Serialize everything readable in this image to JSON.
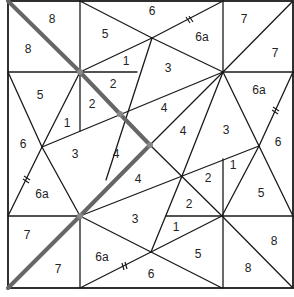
{
  "diagram": {
    "title": "",
    "colors": {
      "edge": "#1a1a1a",
      "highlight_path": "#666666",
      "node": "#888888",
      "background": "#ffffff"
    },
    "labels": [
      {
        "text": "8",
        "x": 52,
        "y": 20
      },
      {
        "text": "8",
        "x": 28,
        "y": 50
      },
      {
        "text": "5",
        "x": 105,
        "y": 35
      },
      {
        "text": "6",
        "x": 152,
        "y": 12
      },
      {
        "text": "6a",
        "x": 202,
        "y": 38
      },
      {
        "text": "7",
        "x": 244,
        "y": 20
      },
      {
        "text": "7",
        "x": 275,
        "y": 54
      },
      {
        "text": "1",
        "x": 126,
        "y": 62
      },
      {
        "text": "3",
        "x": 168,
        "y": 69
      },
      {
        "text": "5",
        "x": 40,
        "y": 96
      },
      {
        "text": "2",
        "x": 113,
        "y": 85
      },
      {
        "text": "2",
        "x": 92,
        "y": 105
      },
      {
        "text": "1",
        "x": 67,
        "y": 124
      },
      {
        "text": "4",
        "x": 164,
        "y": 109
      },
      {
        "text": "6a",
        "x": 259,
        "y": 91
      },
      {
        "text": "6",
        "x": 23,
        "y": 145
      },
      {
        "text": "3",
        "x": 75,
        "y": 155
      },
      {
        "text": "4",
        "x": 116,
        "y": 155
      },
      {
        "text": "4",
        "x": 183,
        "y": 132
      },
      {
        "text": "3",
        "x": 226,
        "y": 131
      },
      {
        "text": "6",
        "x": 278,
        "y": 143
      },
      {
        "text": "1",
        "x": 233,
        "y": 166
      },
      {
        "text": "4",
        "x": 138,
        "y": 180
      },
      {
        "text": "2",
        "x": 208,
        "y": 179
      },
      {
        "text": "5",
        "x": 261,
        "y": 194
      },
      {
        "text": "6a",
        "x": 42,
        "y": 195
      },
      {
        "text": "2",
        "x": 189,
        "y": 205
      },
      {
        "text": "3",
        "x": 135,
        "y": 220
      },
      {
        "text": "1",
        "x": 176,
        "y": 228
      },
      {
        "text": "7",
        "x": 27,
        "y": 236
      },
      {
        "text": "8",
        "x": 274,
        "y": 242
      },
      {
        "text": "6a",
        "x": 102,
        "y": 258
      },
      {
        "text": "5",
        "x": 198,
        "y": 255
      },
      {
        "text": "7",
        "x": 58,
        "y": 270
      },
      {
        "text": "6",
        "x": 151,
        "y": 275
      },
      {
        "text": "8",
        "x": 248,
        "y": 269
      }
    ]
  }
}
